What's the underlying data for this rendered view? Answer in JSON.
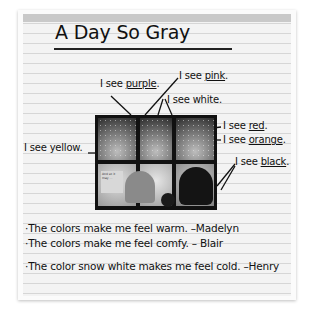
{
  "poster": {
    "title": "A Day So Gray",
    "labels": [
      {
        "prefix": "I see ",
        "color_word": "purple",
        "suffix": "."
      },
      {
        "prefix": "I see ",
        "color_word": "pink",
        "suffix": "."
      },
      {
        "prefix": "I see ",
        "color_word": "white",
        "suffix": "."
      },
      {
        "prefix": "I see ",
        "color_word": "red",
        "suffix": "."
      },
      {
        "prefix": "I see ",
        "color_word": "orange",
        "suffix": "."
      },
      {
        "prefix": "I see ",
        "color_word": "yellow",
        "suffix": "."
      },
      {
        "prefix": "I see ",
        "color_word": "black",
        "suffix": "."
      }
    ],
    "statements": [
      "·The colors make me feel warm. –Madelyn",
      "·The colors make me feel comfy. – Blair",
      "·The color snow white makes me feel cold. –Henry"
    ],
    "photo": {
      "description": "Book illustration of children looking out a snowy window",
      "card_text": "And so it may ..."
    }
  }
}
